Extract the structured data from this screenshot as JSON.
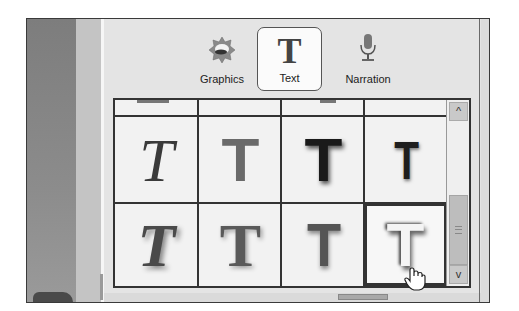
{
  "tabs": [
    {
      "id": "graphics",
      "label": "Graphics",
      "icon": "graphics-starburst-icon",
      "selected": false
    },
    {
      "id": "text",
      "label": "Text",
      "icon": "text-T-icon",
      "selected": true
    },
    {
      "id": "narration",
      "label": "Narration",
      "icon": "microphone-icon",
      "selected": false
    }
  ],
  "text_styles": {
    "rows": [
      [
        {
          "glyph": "T",
          "style": "serif-italic"
        },
        {
          "glyph": "T",
          "style": "block"
        },
        {
          "glyph": "T",
          "style": "block-blur"
        },
        {
          "glyph": "T",
          "style": "thin-blur"
        }
      ],
      [
        {
          "glyph": "T",
          "style": "serif-bold-italic-shadow"
        },
        {
          "glyph": "T",
          "style": "serif-shadow"
        },
        {
          "glyph": "T",
          "style": "block-gray-shadow"
        },
        {
          "glyph": "T",
          "style": "light-embossed",
          "selected": true
        }
      ]
    ]
  },
  "scrollbar": {
    "up_arrow": "^",
    "down_arrow": "v"
  },
  "cursor": "hand-pointer"
}
